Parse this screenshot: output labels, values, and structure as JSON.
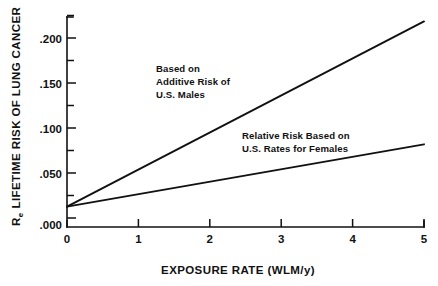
{
  "chart_data": {
    "type": "line",
    "title": "",
    "xlabel": "EXPOSURE RATE (WLM/y)",
    "ylabel": "LIFETIME RISK OF LUNG CANCER",
    "ylabel_symbol": "R",
    "ylabel_symbol_subscript": "e",
    "xlim": [
      0,
      5
    ],
    "ylim": [
      0.0,
      0.2375
    ],
    "grid": false,
    "legend_position": "none",
    "xticks": [
      0,
      1,
      2,
      3,
      4,
      5
    ],
    "xtick_labels": [
      "0",
      "1",
      "2",
      "3",
      "4",
      "5"
    ],
    "yticks": [
      0.0,
      0.05,
      0.1,
      0.15,
      0.2
    ],
    "ytick_labels": [
      ".000",
      ".050",
      ".100",
      ".150",
      ".200"
    ],
    "yticks_minor": [
      0.025,
      0.075,
      0.125,
      0.175,
      0.225
    ],
    "series": [
      {
        "name": "Based on Additive Risk of U.S. Males",
        "x": [
          0,
          5
        ],
        "values": [
          0.023,
          0.2325
        ],
        "color": "#111111"
      },
      {
        "name": "Relative Risk Based on U.S. Rates for Females",
        "x": [
          0,
          5
        ],
        "values": [
          0.023,
          0.0935
        ],
        "color": "#111111"
      }
    ],
    "annotations": [
      {
        "id": "additive-males",
        "lines": [
          "Based on",
          "Additive Risk of",
          "U.S. Males"
        ],
        "x": 1.15,
        "y": 0.178
      },
      {
        "id": "relative-females",
        "lines": [
          "Relative Risk Based on",
          "U.S. Rates for Females"
        ],
        "x": 2.85,
        "y": 0.112
      }
    ]
  },
  "colors": {
    "ink": "#111111",
    "background": "#ffffff"
  }
}
